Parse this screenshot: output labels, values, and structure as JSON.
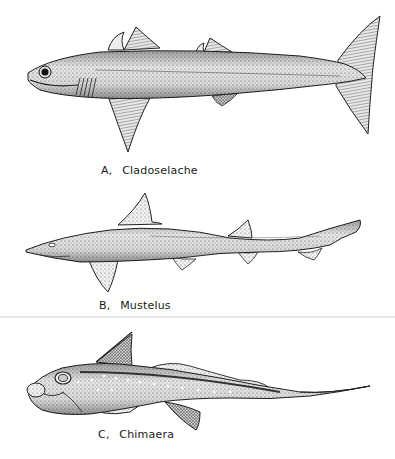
{
  "figure": {
    "panels": [
      {
        "letter": "A,",
        "name": "Cladoselache"
      },
      {
        "letter": "B,",
        "name": "Mustelus"
      },
      {
        "letter": "C,",
        "name": "Chimaera"
      }
    ]
  }
}
